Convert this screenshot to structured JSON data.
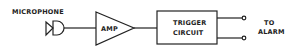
{
  "diagram": {
    "blocks": [
      {
        "id": "microphone",
        "label": "MICROPHONE",
        "type": "microphone-symbol"
      },
      {
        "id": "amp",
        "label": "AMP",
        "type": "triangle-amplifier"
      },
      {
        "id": "trigger",
        "label_line1": "TRIGGER",
        "label_line2": "CIRCUIT",
        "type": "rectangle"
      },
      {
        "id": "output",
        "label_line1": "TO",
        "label_line2": "ALARM",
        "type": "terminal-pair"
      }
    ],
    "connections": [
      {
        "from": "microphone",
        "to": "amp"
      },
      {
        "from": "amp",
        "to": "trigger"
      },
      {
        "from": "trigger",
        "to": "output",
        "count": 2
      }
    ],
    "colors": {
      "line": "#222222",
      "background": "#ffffff"
    }
  }
}
